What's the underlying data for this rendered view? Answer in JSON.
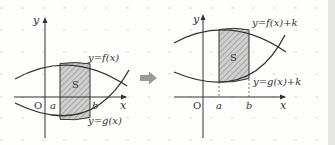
{
  "left_graph": {
    "y_axis_label": "y",
    "x_axis_label": "x",
    "origin_label": "O",
    "a_label": "a",
    "b_label": "b",
    "region_label": "S",
    "f_label": "y=f(x)",
    "g_label": "y=g(x)"
  },
  "arrow": {
    "direction": "right"
  },
  "right_graph": {
    "y_axis_label": "y",
    "x_axis_label": "x",
    "origin_label": "O",
    "a_label": "a",
    "b_label": "b",
    "region_label": "S",
    "f_label": "y=f(x)+k",
    "g_label": "y=g(x)+k"
  },
  "colors": {
    "background": "#fdfdfb",
    "curve": "#333333",
    "hatch_fill": "#c8c8c8",
    "arrow": "#999999",
    "grid": "#d0d0d0"
  }
}
